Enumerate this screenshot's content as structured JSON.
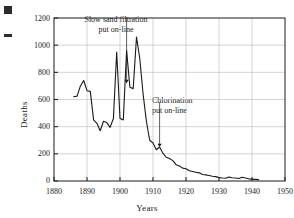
{
  "figure": {
    "edge_marks": [
      "square-mark",
      "dash-mark"
    ]
  },
  "chart_data": {
    "type": "line",
    "title": "",
    "xlabel": "Years",
    "ylabel": "Deaths",
    "xlim": [
      1880,
      1950
    ],
    "ylim": [
      0,
      1200
    ],
    "xticks": [
      1880,
      1890,
      1900,
      1910,
      1920,
      1930,
      1940,
      1950
    ],
    "yticks": [
      0,
      200,
      400,
      600,
      800,
      1000,
      1200
    ],
    "grid": true,
    "legend": null,
    "line_color": "#1a1a1a",
    "grid_color": "#b9b9b9",
    "axis_color": "#1a1a1a",
    "series": [
      {
        "name": "Typhoid deaths",
        "x": [
          1886,
          1887,
          1888,
          1889,
          1890,
          1891,
          1892,
          1893,
          1894,
          1895,
          1896,
          1897,
          1898,
          1899,
          1900,
          1901,
          1902,
          1903,
          1904,
          1905,
          1906,
          1907,
          1908,
          1909,
          1910,
          1911,
          1912,
          1913,
          1914,
          1915,
          1916,
          1917,
          1918,
          1919,
          1920,
          1921,
          1922,
          1923,
          1924,
          1925,
          1926,
          1927,
          1928,
          1929,
          1930,
          1931,
          1932,
          1933,
          1934,
          1935,
          1936,
          1937,
          1938,
          1939,
          1940,
          1941,
          1942
        ],
        "values": [
          620,
          625,
          700,
          740,
          665,
          660,
          450,
          425,
          370,
          440,
          430,
          395,
          460,
          950,
          460,
          450,
          960,
          690,
          680,
          1060,
          900,
          640,
          440,
          300,
          280,
          230,
          250,
          205,
          175,
          165,
          150,
          120,
          110,
          95,
          90,
          75,
          70,
          65,
          60,
          48,
          45,
          40,
          35,
          32,
          25,
          22,
          20,
          30,
          24,
          22,
          18,
          28,
          22,
          16,
          14,
          12,
          10
        ]
      }
    ],
    "annotations": [
      {
        "id": "slow-sand-filtration",
        "line1": "Slow sand filtration",
        "line2": "put on-line",
        "arrow_x": 1902,
        "arrow_y_top": 1200,
        "arrow_y_tip": 720
      },
      {
        "id": "chlorination",
        "line1": "Chlorination",
        "line2": "put on-line",
        "arrow_x": 1912,
        "arrow_y_top": 580,
        "arrow_y_tip": 250
      }
    ]
  },
  "ticks": {
    "y": [
      "1200",
      "1000",
      "800",
      "600",
      "400",
      "200",
      "0"
    ],
    "x": [
      "1880",
      "1890",
      "1900",
      "1910",
      "1920",
      "1930",
      "1940",
      "1950"
    ]
  },
  "labels": {
    "y_axis_title": "Deaths",
    "x_axis_title": "Years",
    "annotation_filtration_line1": "Slow sand filtration",
    "annotation_filtration_line2": "put on-line",
    "annotation_chlorination_line1": "Chlorination",
    "annotation_chlorination_line2": "put on-line"
  }
}
